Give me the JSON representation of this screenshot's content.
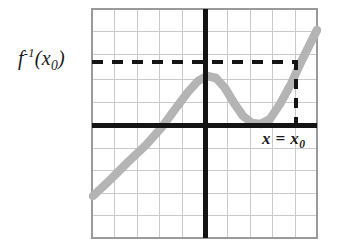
{
  "figure": {
    "background_color": "#ffffff"
  },
  "labels": {
    "y_value": {
      "base": "f",
      "superscript": "-1",
      "open_paren": "(",
      "argument": "x",
      "argument_subscript": "0",
      "close_paren": ")",
      "full_text": "f-1(x0)"
    },
    "x_value": {
      "variable": "x",
      "equals": "=",
      "value": "x",
      "value_subscript": "0",
      "full_text": "x = x0"
    }
  },
  "colors": {
    "curve": "#b4b4b4",
    "axis": "#141414",
    "grid": "#c9c9c9",
    "border": "#9a9a9a",
    "dashed": "#141414",
    "text": "#1a1a1a"
  },
  "chart_data": {
    "type": "line",
    "title": "",
    "xlabel": "",
    "ylabel": "",
    "grid": true,
    "legend": null,
    "plot_box_px": {
      "left": 92,
      "top": 9,
      "right": 317,
      "bottom": 238
    },
    "grid_columns": 10,
    "grid_rows": 10,
    "grid_spacing_px": 22.5,
    "axes": {
      "x_axis_y_px": 125,
      "y_axis_x_px": 205,
      "x_axis_label": "",
      "y_axis_label": ""
    },
    "xlim": [
      -5,
      5
    ],
    "ylim": [
      -5,
      5
    ],
    "annotations": [
      {
        "name": "horizontal-dashed-line",
        "type": "dashed-horizontal",
        "y_px": 62,
        "x_start_px": 92,
        "x_end_px": 297,
        "label": "f-1(x0)"
      },
      {
        "name": "vertical-dashed-line",
        "type": "dashed-vertical",
        "x_px": 296,
        "y_start_px": 62,
        "y_end_px": 125,
        "label": "x = x0"
      }
    ],
    "series": [
      {
        "name": "curve",
        "color": "#b4b4b4",
        "points_px": [
          [
            93,
            196
          ],
          [
            110,
            180
          ],
          [
            128,
            162
          ],
          [
            146,
            145
          ],
          [
            162,
            127
          ],
          [
            176,
            108
          ],
          [
            188,
            92
          ],
          [
            198,
            81
          ],
          [
            207,
            76
          ],
          [
            216,
            78
          ],
          [
            225,
            88
          ],
          [
            234,
            103
          ],
          [
            243,
            116
          ],
          [
            252,
            123
          ],
          [
            261,
            124
          ],
          [
            270,
            119
          ],
          [
            280,
            104
          ],
          [
            291,
            84
          ],
          [
            302,
            60
          ],
          [
            310,
            44
          ],
          [
            317,
            30
          ]
        ]
      }
    ]
  }
}
